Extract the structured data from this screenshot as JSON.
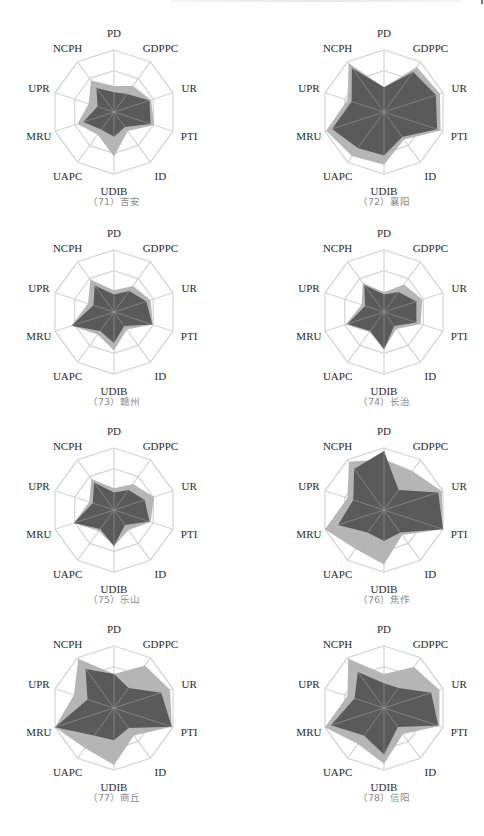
{
  "chart_data": {
    "type": "radar",
    "axes": [
      "PD",
      "GDPPC",
      "UR",
      "PTI",
      "ID",
      "UDIB",
      "UAPC",
      "MRU",
      "UPR",
      "NCPH"
    ],
    "scale": [
      0,
      1
    ],
    "rings": 3,
    "grid": true,
    "legend": "none",
    "series_names": [
      "outer (light gray)",
      "inner (dark gray)"
    ],
    "charts": [
      {
        "caption": "（71）吉安",
        "outer": [
          0.42,
          0.52,
          0.63,
          0.68,
          0.38,
          0.72,
          0.45,
          0.62,
          0.43,
          0.63
        ],
        "inner": [
          0.32,
          0.36,
          0.6,
          0.62,
          0.3,
          0.4,
          0.35,
          0.52,
          0.28,
          0.48
        ]
      },
      {
        "caption": "（72）襄阳",
        "outer": [
          0.4,
          0.9,
          0.95,
          0.96,
          0.55,
          0.85,
          0.88,
          0.98,
          0.62,
          0.97
        ],
        "inner": [
          0.4,
          0.8,
          0.88,
          0.9,
          0.5,
          0.7,
          0.72,
          0.88,
          0.55,
          0.88
        ]
      },
      {
        "caption": "（73）赣州",
        "outer": [
          0.35,
          0.52,
          0.62,
          0.66,
          0.35,
          0.62,
          0.45,
          0.72,
          0.44,
          0.65
        ],
        "inner": [
          0.28,
          0.42,
          0.55,
          0.65,
          0.28,
          0.5,
          0.38,
          0.72,
          0.35,
          0.53
        ]
      },
      {
        "caption": "（74）长治",
        "outer": [
          0.32,
          0.55,
          0.65,
          0.62,
          0.34,
          0.6,
          0.4,
          0.65,
          0.38,
          0.58
        ],
        "inner": [
          0.28,
          0.4,
          0.55,
          0.55,
          0.28,
          0.6,
          0.38,
          0.62,
          0.32,
          0.54
        ]
      },
      {
        "caption": "（75）乐山",
        "outer": [
          0.35,
          0.52,
          0.68,
          0.62,
          0.4,
          0.58,
          0.42,
          0.68,
          0.42,
          0.62
        ],
        "inner": [
          0.28,
          0.4,
          0.52,
          0.6,
          0.3,
          0.58,
          0.38,
          0.68,
          0.36,
          0.55
        ]
      },
      {
        "caption": "（76）焦作",
        "outer": [
          0.82,
          0.78,
          0.98,
          1.0,
          0.5,
          0.88,
          0.78,
          1.0,
          0.62,
          0.96
        ],
        "inner": [
          0.95,
          0.4,
          0.92,
          1.0,
          0.45,
          0.5,
          0.45,
          0.78,
          0.52,
          0.82
        ]
      },
      {
        "caption": "（77）商丘",
        "outer": [
          0.55,
          0.85,
          0.95,
          0.98,
          0.55,
          0.92,
          0.8,
          1.0,
          0.68,
          0.98
        ],
        "inner": [
          0.55,
          0.4,
          0.8,
          0.98,
          0.4,
          0.52,
          0.55,
          1.0,
          0.45,
          0.78
        ]
      },
      {
        "caption": "（78）信阳",
        "outer": [
          0.55,
          0.82,
          0.94,
          0.94,
          0.52,
          0.9,
          0.72,
          1.0,
          0.62,
          0.98
        ],
        "inner": [
          0.4,
          0.4,
          0.8,
          0.92,
          0.38,
          0.75,
          0.55,
          0.9,
          0.5,
          0.72
        ]
      }
    ]
  },
  "layout": {
    "centers": [
      [
        114,
        112
      ],
      [
        384,
        112
      ],
      [
        114,
        312
      ],
      [
        384,
        312
      ],
      [
        114,
        510
      ],
      [
        384,
        510
      ],
      [
        114,
        708
      ],
      [
        384,
        708
      ]
    ],
    "radius": 62,
    "label_offset": 17,
    "caption_offset": 93
  },
  "colors": {
    "outer_fill": "#b5b5b5",
    "inner_fill": "#5a5a5a",
    "grid": "#d4d4d4",
    "spoke_inner": "#8a8a8a",
    "label": "#2a2a2a",
    "caption": "#8a8a8a"
  }
}
